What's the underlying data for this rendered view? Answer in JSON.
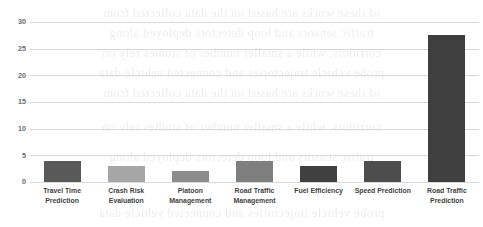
{
  "chart_data": {
    "type": "bar",
    "title": "",
    "subtitle": "",
    "xlabel": "",
    "ylabel": "",
    "categories": [
      "Travel Time Prediction",
      "Crash Risk Evaluation",
      "Platoon Management",
      "Road Traffic Management",
      "Fuel Efficiency",
      "Speed Prediction",
      "Road Traffic Prediction"
    ],
    "category_lines": [
      [
        "Travel Time",
        "Prediction"
      ],
      [
        "Crash Risk",
        "Evaluation"
      ],
      [
        "Platoon",
        "Management"
      ],
      [
        "Road Traffic",
        "Management"
      ],
      [
        "Fuel Efficiency",
        ""
      ],
      [
        "Speed Prediction",
        ""
      ],
      [
        "Road Traffic",
        "Prediction"
      ]
    ],
    "values": [
      4,
      3,
      2,
      4,
      3,
      4,
      27.5
    ],
    "bar_colors": [
      "#595959",
      "#a6a6a6",
      "#8c8c8c",
      "#7f7f7f",
      "#404040",
      "#4d4d4d",
      "#3f3f3f"
    ],
    "ylim": [
      0,
      30
    ],
    "yticks": [
      0,
      5,
      10,
      15,
      20,
      25,
      30
    ],
    "ytick_labels": [
      "0",
      "5",
      "10",
      "15",
      "20",
      "25",
      "30"
    ],
    "grid": true,
    "grid_color": "#d9d9d9",
    "legend": "none",
    "legend_position": "none",
    "annotations": []
  },
  "background": {
    "bleed_through_lines": [
      "of these works are based on the data collected from",
      "traffic sensors and loop detectors deployed along",
      "corridors, while a smaller number of studies rely on",
      "probe vehicle trajectories and connected vehicle data"
    ]
  }
}
